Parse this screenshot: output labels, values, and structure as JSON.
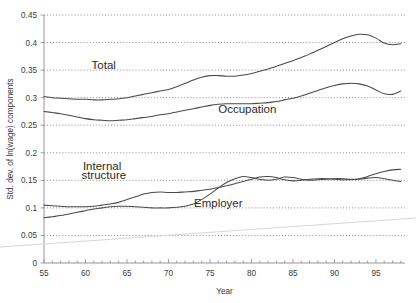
{
  "chart_data": {
    "type": "line",
    "title": "",
    "xlabel": "Year",
    "ylabel": "Std. dev. of ln(wage) components",
    "xlim": [
      55,
      98.5
    ],
    "ylim": [
      0,
      0.45
    ],
    "grid": true,
    "legend_position": "inline-annotations",
    "x_ticks_major": [
      55,
      60,
      65,
      70,
      75,
      80,
      85,
      90,
      95
    ],
    "x_tick_labels": [
      "55",
      "60",
      "65",
      "70",
      "75",
      "80",
      "85",
      "90",
      "95"
    ],
    "x_minor_tick_step": 1,
    "y_ticks": [
      0,
      0.05,
      0.1,
      0.15,
      0.2,
      0.25,
      0.3,
      0.35,
      0.4,
      0.45
    ],
    "y_tick_labels": [
      "0",
      "0.05",
      "0.1",
      "0.15",
      "0.2",
      "0.25",
      "0.3",
      "0.35",
      "0.4",
      "0.45"
    ],
    "x": [
      55,
      56,
      57,
      58,
      59,
      60,
      61,
      62,
      63,
      64,
      65,
      66,
      67,
      68,
      69,
      70,
      71,
      72,
      73,
      74,
      75,
      76,
      77,
      78,
      79,
      80,
      81,
      82,
      83,
      84,
      85,
      86,
      87,
      88,
      89,
      90,
      91,
      92,
      93,
      94,
      95,
      96,
      97,
      98
    ],
    "series": [
      {
        "name": "Total",
        "label": "Total",
        "values": [
          0.302,
          0.3,
          0.299,
          0.298,
          0.297,
          0.297,
          0.296,
          0.296,
          0.297,
          0.298,
          0.3,
          0.303,
          0.306,
          0.309,
          0.312,
          0.315,
          0.32,
          0.326,
          0.332,
          0.337,
          0.34,
          0.34,
          0.339,
          0.339,
          0.341,
          0.344,
          0.348,
          0.352,
          0.357,
          0.362,
          0.367,
          0.373,
          0.379,
          0.386,
          0.393,
          0.4,
          0.407,
          0.412,
          0.415,
          0.414,
          0.408,
          0.399,
          0.396,
          0.398
        ]
      },
      {
        "name": "Occupation",
        "label": "Occupation",
        "values": [
          0.275,
          0.273,
          0.271,
          0.268,
          0.265,
          0.262,
          0.26,
          0.259,
          0.258,
          0.259,
          0.26,
          0.262,
          0.264,
          0.266,
          0.269,
          0.271,
          0.274,
          0.277,
          0.28,
          0.283,
          0.286,
          0.288,
          0.289,
          0.289,
          0.289,
          0.289,
          0.29,
          0.291,
          0.293,
          0.296,
          0.299,
          0.303,
          0.308,
          0.313,
          0.318,
          0.322,
          0.325,
          0.326,
          0.325,
          0.321,
          0.314,
          0.307,
          0.306,
          0.312
        ]
      },
      {
        "name": "Internal structure",
        "label": "Internal structure",
        "values": [
          0.105,
          0.104,
          0.103,
          0.102,
          0.102,
          0.102,
          0.103,
          0.105,
          0.107,
          0.11,
          0.115,
          0.12,
          0.125,
          0.128,
          0.129,
          0.128,
          0.128,
          0.129,
          0.13,
          0.132,
          0.134,
          0.137,
          0.14,
          0.144,
          0.148,
          0.152,
          0.156,
          0.157,
          0.155,
          0.151,
          0.149,
          0.15,
          0.152,
          0.153,
          0.153,
          0.152,
          0.151,
          0.151,
          0.152,
          0.154,
          0.155,
          0.153,
          0.15,
          0.148
        ]
      },
      {
        "name": "Employer",
        "label": "Employer",
        "values": [
          0.082,
          0.084,
          0.086,
          0.089,
          0.092,
          0.095,
          0.098,
          0.1,
          0.102,
          0.103,
          0.103,
          0.102,
          0.101,
          0.1,
          0.1,
          0.1,
          0.101,
          0.103,
          0.107,
          0.115,
          0.125,
          0.136,
          0.146,
          0.153,
          0.157,
          0.155,
          0.152,
          0.15,
          0.152,
          0.156,
          0.155,
          0.152,
          0.15,
          0.151,
          0.152,
          0.153,
          0.153,
          0.152,
          0.153,
          0.157,
          0.162,
          0.166,
          0.169,
          0.17
        ]
      }
    ],
    "annotations": [
      {
        "text": "Total",
        "x": 62.2,
        "y": 0.352
      },
      {
        "text": "Occupation",
        "x": 79.5,
        "y": 0.272
      },
      {
        "text": "Internal",
        "x": 62.0,
        "y": 0.168
      },
      {
        "text": "structure",
        "x": 62.2,
        "y": 0.152
      },
      {
        "text": "Employer",
        "x": 76.0,
        "y": 0.101
      }
    ],
    "artifact_line": {
      "name": "faint-diagonal-artifact",
      "color": "#d6d6d6",
      "from": {
        "x_px": 0,
        "y_px": 247
      },
      "to": {
        "x_px": 416,
        "y_px": 218
      }
    },
    "colors": {
      "line": "#4a4a4a",
      "grid": "#6e6e6e",
      "axis": "#8a8a8a",
      "text": "#3a3a3a",
      "background": "#ffffff"
    }
  }
}
